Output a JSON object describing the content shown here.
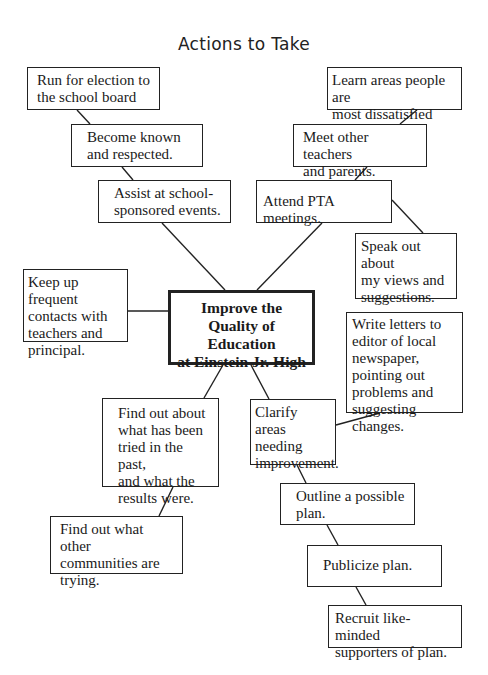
{
  "title": "Actions to Take",
  "center": {
    "label": "Improve the\nQuality of Education\nat Einstein Jr. High"
  },
  "nodes": {
    "run_for_election": "Run for election to\nthe school board",
    "become_known": "Become known\nand respected.",
    "assist_events": "Assist at school-\nsponsored events.",
    "learn_areas": "Learn areas people are\nmost dissatisfied with.",
    "meet_teachers": "Meet other teachers\nand parents.",
    "attend_pta": "Attend PTA meetings.",
    "speak_out": "Speak out about\nmy views and\nsuggestions.",
    "keep_contacts": "Keep up frequent\ncontacts with\nteachers and\nprincipal.",
    "write_letters": "Write letters to\neditor of local\nnewspaper,\npointing out\nproblems and\nsuggesting changes.",
    "find_past": "Find out about\nwhat has been\ntried in the past,\nand what the\nresults were.",
    "clarify_areas": "Clarify areas\nneeding\nimprovement.",
    "find_other_communities": "Find out what other\ncommunities are\ntrying.",
    "outline_plan": "Outline a possible\nplan.",
    "publicize_plan": "Publicize plan.",
    "recruit_supporters": "Recruit like-minded\nsupporters of plan."
  },
  "colors": {
    "line": "#222222",
    "background": "#ffffff"
  }
}
